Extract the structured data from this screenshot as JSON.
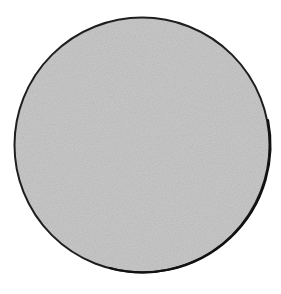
{
  "figure": {
    "shape": "circle",
    "fill_color": "#c9c9c9",
    "outline_color": "#1e1e1e",
    "texture": "grainy-gray",
    "center": {
      "x": 142,
      "y": 145
    },
    "radius": 128
  }
}
